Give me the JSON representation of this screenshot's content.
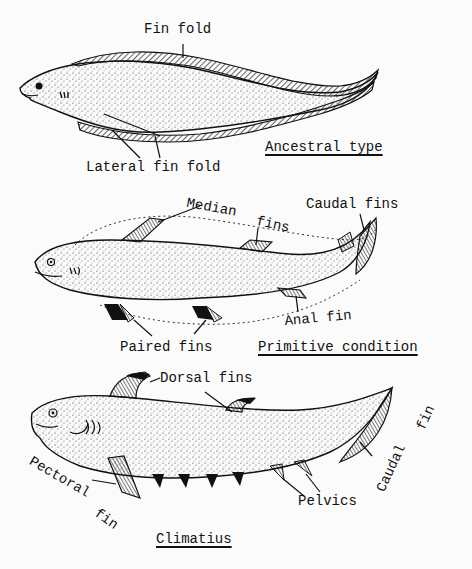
{
  "figure": {
    "panels": [
      {
        "id": "ancestral",
        "title": "Ancestral type",
        "labels": [
          "Fin fold",
          "Lateral fin fold"
        ]
      },
      {
        "id": "primitive",
        "title": "Primitive condition",
        "labels": [
          "Median fins",
          "Caudal fins",
          "Anal fin",
          "Paired fins"
        ]
      },
      {
        "id": "climatius",
        "title": "Climatius",
        "labels": [
          "Dorsal fins",
          "Caudal fin",
          "Pectoral fin",
          "Pelvics"
        ]
      }
    ]
  },
  "labels": {
    "fin_fold": "Fin fold",
    "lateral_fin_fold": "Lateral fin fold",
    "ancestral_type": "Ancestral type",
    "median": "Median",
    "fins_median": "fins",
    "caudal_fins": "Caudal fins",
    "anal_fin": "Anal fin",
    "paired_fins": "Paired fins",
    "primitive_condition": "Primitive condition",
    "dorsal_fins": "Dorsal fins",
    "caudal": "Caudal",
    "fin_caudal": "fin",
    "pectoral": "Pectoral",
    "fin_pectoral": "fin",
    "pelvics": "Pelvics",
    "climatius": "Climatius"
  },
  "colors": {
    "ink": "#111111",
    "paper": "#fbfbfb"
  }
}
